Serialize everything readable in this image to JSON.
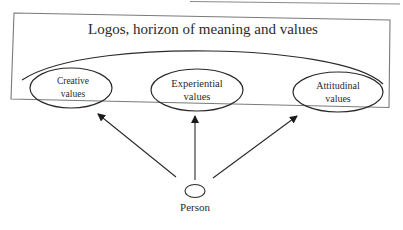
{
  "diagram": {
    "title": "Logos, horizon of meaning and values",
    "values": [
      {
        "id": "creative",
        "line1": "Creative",
        "line2": "values"
      },
      {
        "id": "experiential",
        "line1": "Experiential",
        "line2": "values"
      },
      {
        "id": "attitudinal",
        "line1": "Attitudinal",
        "line2": "values"
      }
    ],
    "source_node": {
      "label": "Person"
    },
    "colors": {
      "stroke": "#2a2a2a",
      "frame": "#7a7a7a",
      "background": "#ffffff"
    }
  }
}
